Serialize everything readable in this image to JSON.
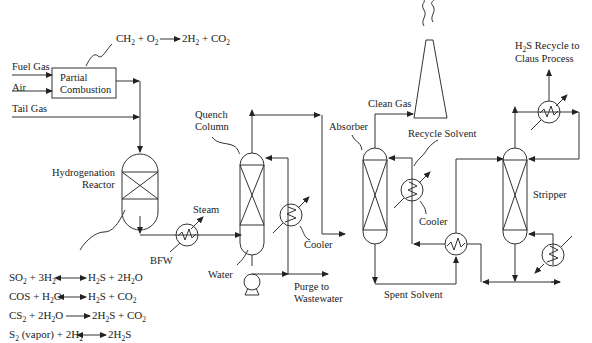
{
  "inputs": {
    "fuel_gas": "Fuel Gas",
    "air": "Air",
    "tail_gas": "Tail Gas"
  },
  "units": {
    "partial_combustion": [
      "Partial",
      "Combustion"
    ],
    "hydrogenation_reactor": [
      "Hydrogenation",
      "Reactor"
    ],
    "quench_column": [
      "Quench",
      "Column"
    ],
    "absorber": "Absorber",
    "stripper": "Stripper",
    "cooler_quench": "Cooler",
    "cooler_absorber": "Cooler"
  },
  "streams": {
    "steam": "Steam",
    "bfw": "BFW",
    "water": "Water",
    "purge": [
      "Purge to",
      "Wastewater"
    ],
    "clean_gas": "Clean Gas",
    "recycle_solvent": "Recycle Solvent",
    "spent_solvent": "Spent Solvent",
    "h2s_recycle": [
      "H",
      "2",
      "S Recycle to"
    ],
    "claus": "Claus Process"
  },
  "reactions": {
    "combustion": {
      "lhs": [
        "CH",
        "2",
        " + O",
        "2"
      ],
      "rhs": [
        "2H",
        "2",
        " + CO",
        "2"
      ]
    },
    "hydrogenation": [
      {
        "lhs": [
          "SO",
          "2",
          " + 3H",
          "2"
        ],
        "arrow": "reversible",
        "rhs": [
          "H",
          "2",
          "S + 2H",
          "2",
          "O"
        ]
      },
      {
        "lhs": [
          "COS + H",
          "2",
          "O"
        ],
        "arrow": "reversible",
        "rhs": [
          "H",
          "2",
          "S + CO",
          "2"
        ]
      },
      {
        "lhs": [
          "CS",
          "2",
          " + 2H",
          "2",
          "O"
        ],
        "arrow": "forward",
        "rhs": [
          "2H",
          "2",
          "S + CO",
          "2"
        ]
      },
      {
        "lhs": [
          "S",
          "2",
          " (vapor) + 2H",
          "2"
        ],
        "arrow": "reversible",
        "rhs": [
          "2H",
          "2",
          "S"
        ]
      }
    ]
  },
  "colors": {
    "line": "#333333",
    "text": "#222222",
    "background": "#ffffff"
  }
}
